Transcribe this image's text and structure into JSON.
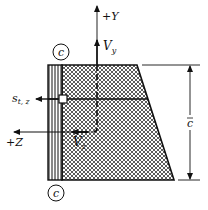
{
  "diagram": {
    "labels": {
      "plus_y": "+Y",
      "v_y": "V",
      "v_y_sub": "y",
      "plus_z": "+Z",
      "v_z": "V",
      "v_z_sub": "z",
      "s_tz": "s",
      "s_tz_sub": "t, z",
      "c_top": "c",
      "c_bottom": "c",
      "c_bar": "c"
    },
    "regions": [
      {
        "name": "vertical-striped-strip",
        "pattern": "vertical-lines"
      },
      {
        "name": "hatched-trapezoid",
        "pattern": "crosshatch"
      }
    ],
    "colors": {
      "ink": "#111111",
      "background": "#ffffff"
    }
  }
}
